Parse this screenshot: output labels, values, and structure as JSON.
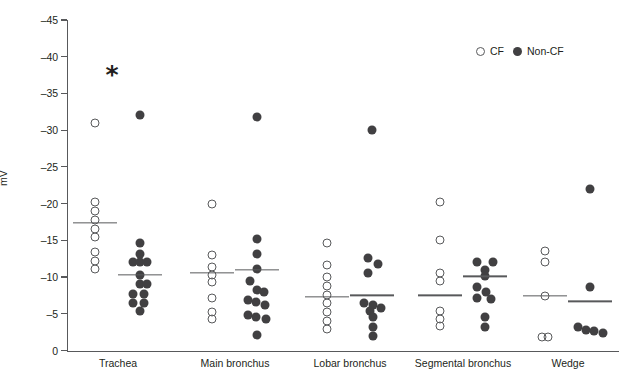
{
  "chart_data": {
    "type": "scatter",
    "title": "",
    "subtitle": "",
    "xlabel": "",
    "ylabel": "mV",
    "grid": false,
    "legend_position": "top-right",
    "yaxis": {
      "tick_labels": [
        "0",
        "–5",
        "–10",
        "–15",
        "–20",
        "–25",
        "–30",
        "–35",
        "–40",
        "–45"
      ],
      "tick_values": [
        0,
        -5,
        -10,
        -15,
        -20,
        -25,
        -30,
        -35,
        -40,
        -45
      ],
      "min": 0,
      "max": -45,
      "inverted": true
    },
    "legend": [
      {
        "name": "CF",
        "marker": "open-circle"
      },
      {
        "name": "Non-CF",
        "marker": "filled-circle"
      }
    ],
    "annotations": [
      {
        "text": "*",
        "x_category": "Trachea",
        "y": -36.5,
        "meaning": "significance-marker"
      }
    ],
    "categories": [
      "Trachea",
      "Main bronchus",
      "Lobar bronchus",
      "Segmental bronchus",
      "Wedge"
    ],
    "groups": [
      {
        "category": "Trachea",
        "series": [
          {
            "name": "CF",
            "mean": -17.4,
            "values": [
              -31.0,
              -20.2,
              -19.0,
              -17.8,
              -16.6,
              -15.4,
              -13.4,
              -12.2,
              -11.1
            ],
            "jitter": [
              0,
              0,
              0,
              0,
              0,
              0,
              0,
              0,
              0
            ]
          },
          {
            "name": "Non-CF",
            "mean": -10.3,
            "values": [
              -32.0,
              -14.6,
              -13.2,
              -12.0,
              -12.0,
              -12.0,
              -10.3,
              -9.0,
              -9.0,
              -7.7,
              -7.7,
              -6.5,
              -6.5,
              -5.4
            ],
            "jitter": [
              0,
              0,
              0,
              -7,
              0,
              7,
              0,
              0,
              7,
              -7,
              4,
              -7,
              4,
              0
            ]
          }
        ]
      },
      {
        "category": "Main bronchus",
        "series": [
          {
            "name": "CF",
            "mean": -10.6,
            "values": [
              -20.0,
              -13.0,
              -11.4,
              -10.3,
              -9.3,
              -7.2,
              -5.3,
              -4.3
            ],
            "jitter": [
              0,
              0,
              0,
              0,
              0,
              0,
              0,
              0
            ]
          },
          {
            "name": "Non-CF",
            "mean": -11.0,
            "values": [
              -31.8,
              -15.2,
              -13.2,
              -11.1,
              -9.4,
              -8.3,
              -8.0,
              -6.9,
              -6.6,
              -6.2,
              -4.9,
              -4.6,
              -4.3,
              -2.1
            ],
            "jitter": [
              0,
              0,
              0,
              0,
              -7,
              0,
              7,
              -9,
              -1,
              8,
              -9,
              -1,
              9,
              0
            ]
          }
        ]
      },
      {
        "category": "Lobar bronchus",
        "series": [
          {
            "name": "CF",
            "mean": -7.3,
            "values": [
              -14.6,
              -11.6,
              -10.0,
              -8.8,
              -7.6,
              -6.4,
              -5.2,
              -4.0,
              -2.9
            ],
            "jitter": [
              0,
              0,
              0,
              0,
              0,
              0,
              0,
              0,
              0
            ]
          },
          {
            "name": "Non-CF",
            "mean": -7.5,
            "values": [
              -30.0,
              -12.6,
              -11.8,
              -10.5,
              -6.4,
              -6.2,
              -5.8,
              -5.4,
              -4.5,
              -3.2,
              -2.0
            ],
            "jitter": [
              0,
              -4,
              6,
              -4,
              -8,
              1,
              9,
              -2,
              1,
              1,
              1
            ]
          }
        ]
      },
      {
        "category": "Segmental bronchus",
        "series": [
          {
            "name": "CF",
            "mean": -7.5,
            "values": [
              -20.2,
              -15.0,
              -10.5,
              -9.4,
              -5.4,
              -4.3,
              -3.3
            ],
            "jitter": [
              0,
              0,
              0,
              0,
              0,
              0,
              0
            ]
          },
          {
            "name": "Non-CF",
            "mean": -10.1,
            "values": [
              -12.0,
              -12.0,
              -10.9,
              -10.1,
              -8.7,
              -8.0,
              -7.2,
              -7.0,
              -4.6,
              -3.2
            ],
            "jitter": [
              -8,
              8,
              0,
              0,
              -8,
              1,
              -8,
              6,
              0,
              0
            ]
          }
        ]
      },
      {
        "category": "Wedge",
        "series": [
          {
            "name": "CF",
            "mean": -7.4,
            "values": [
              -13.5,
              -12.0,
              -7.4,
              -1.8,
              -1.8
            ],
            "jitter": [
              0,
              0,
              0,
              -3,
              3
            ]
          },
          {
            "name": "Non-CF",
            "mean": -6.7,
            "values": [
              -22.0,
              -8.6,
              -3.2,
              -2.8,
              -2.6,
              -2.4
            ],
            "jitter": [
              0,
              0,
              -12,
              -4,
              4,
              13
            ]
          }
        ]
      }
    ]
  },
  "colors": {
    "axis": "#58595b",
    "text": "#231f20",
    "marker_filled": "#414042",
    "marker_open_stroke": "#58595b",
    "background": "#ffffff"
  }
}
